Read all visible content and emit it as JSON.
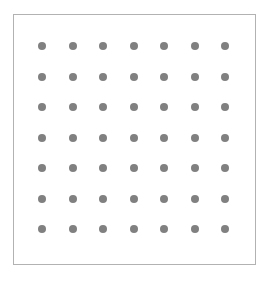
{
  "canvas": {
    "width": 269,
    "height": 281,
    "background_color": "#ffffff"
  },
  "panel": {
    "name": "dot-grid-panel",
    "x": 13,
    "y": 14,
    "width": 243,
    "height": 251,
    "background_color": "#ffffff",
    "border_color": "#b2b2b2",
    "border_width": 1
  },
  "grid": {
    "rows": 7,
    "columns": 7,
    "total_dots": 49,
    "dot_color": "#808080",
    "dot_diameter": 8,
    "first_dot_x": 28,
    "first_dot_y": 31,
    "spacing_x": 30.5,
    "spacing_y": 30.5
  }
}
